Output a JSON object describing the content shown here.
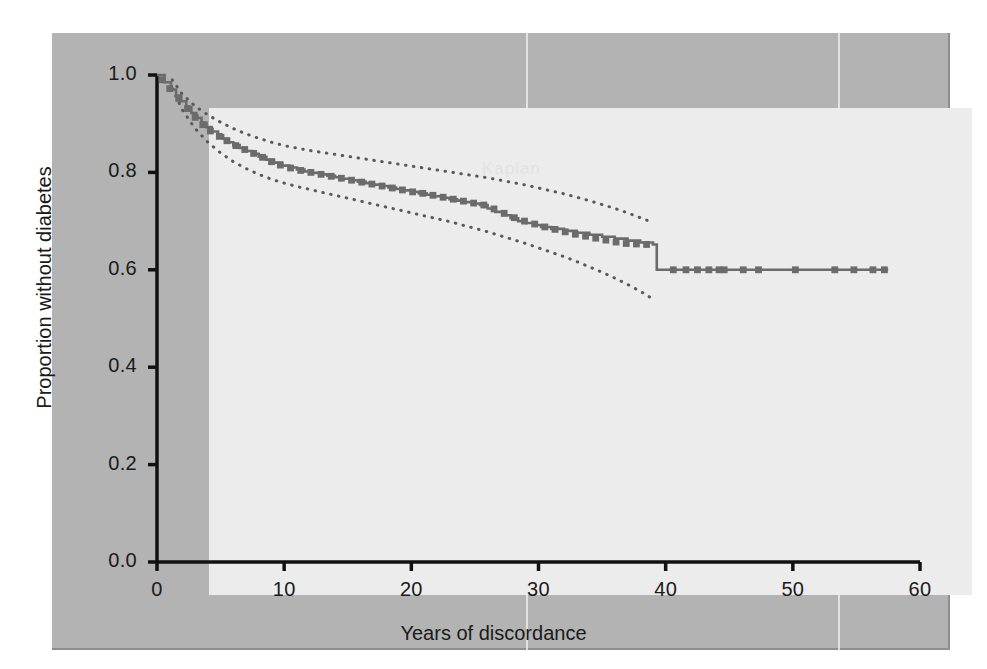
{
  "figure": {
    "watermark_text": "Kaplan",
    "panel_color": "#b3b3b3",
    "plot_bg_color": "#ececec",
    "curve_color": "#6b6b6b",
    "ci_color": "#595959",
    "axis_color": "#111111"
  },
  "chart_data": {
    "type": "line",
    "title": "",
    "subtitle": "",
    "xlabel": "Years of discordance",
    "ylabel": "Proportion without diabetes",
    "xlim": [
      0,
      60
    ],
    "ylim": [
      0.0,
      1.0
    ],
    "xticks": [
      0,
      10,
      20,
      30,
      40,
      50,
      60
    ],
    "xtick_labels": [
      "0",
      "10",
      "20",
      "30",
      "40",
      "50",
      "60"
    ],
    "yticks": [
      0.0,
      0.2,
      0.4,
      0.6,
      0.8,
      1.0
    ],
    "ytick_labels": [
      "0.0",
      "0.2",
      "0.4",
      "0.6",
      "0.8",
      "1.0"
    ],
    "grid": false,
    "legend": null,
    "legend_position": "none",
    "annotations": [],
    "series": [
      {
        "name": "Proportion without diabetes (Kaplan-Meier estimate)",
        "style": "step",
        "color": "#6b6b6b",
        "x": [
          0.0,
          0.6,
          1.1,
          1.5,
          1.9,
          2.3,
          2.7,
          3.1,
          3.5,
          3.9,
          4.3,
          4.8,
          5.2,
          5.6,
          6.0,
          6.5,
          7.0,
          7.5,
          8.0,
          8.6,
          9.2,
          9.8,
          10.4,
          11.0,
          11.6,
          12.2,
          12.8,
          13.4,
          14.0,
          14.6,
          15.2,
          15.8,
          16.4,
          17.0,
          17.6,
          18.2,
          18.8,
          19.4,
          20.0,
          20.6,
          21.2,
          21.8,
          22.4,
          23.0,
          23.6,
          24.2,
          24.8,
          25.4,
          26.0,
          26.6,
          27.2,
          27.8,
          28.4,
          29.0,
          29.6,
          30.2,
          31.0,
          32.0,
          33.0,
          34.0,
          35.0,
          36.0,
          37.0,
          38.0,
          39.0,
          39.3,
          57.5
        ],
        "y": [
          1.0,
          0.985,
          0.97,
          0.958,
          0.946,
          0.934,
          0.922,
          0.912,
          0.902,
          0.893,
          0.884,
          0.876,
          0.869,
          0.862,
          0.856,
          0.85,
          0.844,
          0.838,
          0.832,
          0.826,
          0.82,
          0.814,
          0.81,
          0.806,
          0.802,
          0.799,
          0.796,
          0.793,
          0.79,
          0.787,
          0.784,
          0.781,
          0.778,
          0.775,
          0.772,
          0.769,
          0.766,
          0.763,
          0.76,
          0.757,
          0.754,
          0.751,
          0.748,
          0.745,
          0.742,
          0.739,
          0.736,
          0.733,
          0.726,
          0.719,
          0.712,
          0.706,
          0.7,
          0.696,
          0.692,
          0.688,
          0.684,
          0.68,
          0.676,
          0.672,
          0.668,
          0.664,
          0.66,
          0.656,
          0.652,
          0.6,
          0.6
        ]
      },
      {
        "name": "Upper 95% confidence limit",
        "style": "dotted",
        "color": "#595959",
        "x": [
          1.2,
          2.0,
          3.0,
          4.0,
          5.0,
          6.0,
          7.0,
          8.0,
          9.0,
          10.0,
          11.0,
          12.0,
          13.0,
          14.0,
          15.0,
          16.0,
          17.0,
          18.0,
          19.0,
          20.0,
          21.0,
          22.0,
          23.0,
          24.0,
          25.0,
          26.0,
          27.0,
          28.0,
          29.0,
          30.0,
          31.0,
          32.0,
          33.0,
          34.0,
          35.0,
          36.0,
          37.0,
          38.0,
          39.0
        ],
        "y": [
          0.99,
          0.96,
          0.936,
          0.918,
          0.903,
          0.89,
          0.879,
          0.87,
          0.862,
          0.855,
          0.85,
          0.845,
          0.841,
          0.837,
          0.833,
          0.829,
          0.825,
          0.821,
          0.817,
          0.813,
          0.809,
          0.805,
          0.801,
          0.797,
          0.793,
          0.789,
          0.784,
          0.779,
          0.774,
          0.768,
          0.762,
          0.756,
          0.749,
          0.742,
          0.734,
          0.726,
          0.717,
          0.707,
          0.697
        ]
      },
      {
        "name": "Lower 95% confidence limit",
        "style": "dotted",
        "color": "#595959",
        "x": [
          1.2,
          2.0,
          3.0,
          4.0,
          5.0,
          6.0,
          7.0,
          8.0,
          9.0,
          10.0,
          11.0,
          12.0,
          13.0,
          14.0,
          15.0,
          16.0,
          17.0,
          18.0,
          19.0,
          20.0,
          21.0,
          22.0,
          23.0,
          24.0,
          25.0,
          26.0,
          27.0,
          28.0,
          29.0,
          30.0,
          31.0,
          32.0,
          33.0,
          34.0,
          35.0,
          36.0,
          37.0,
          38.0,
          39.0
        ],
        "y": [
          0.972,
          0.928,
          0.89,
          0.862,
          0.84,
          0.822,
          0.808,
          0.796,
          0.786,
          0.778,
          0.771,
          0.765,
          0.759,
          0.753,
          0.747,
          0.741,
          0.735,
          0.729,
          0.723,
          0.717,
          0.711,
          0.705,
          0.699,
          0.692,
          0.685,
          0.678,
          0.67,
          0.662,
          0.654,
          0.645,
          0.636,
          0.627,
          0.617,
          0.606,
          0.595,
          0.583,
          0.57,
          0.556,
          0.54
        ]
      }
    ],
    "censor_marks": {
      "name": "Censored observations",
      "x": [
        0.4,
        1.0,
        1.7,
        2.4,
        3.0,
        3.6,
        4.2,
        4.9,
        5.5,
        6.2,
        6.9,
        7.6,
        8.3,
        9.0,
        9.7,
        10.5,
        11.3,
        12.1,
        12.9,
        13.7,
        14.5,
        15.3,
        16.1,
        16.9,
        17.7,
        18.5,
        19.3,
        20.1,
        20.9,
        21.7,
        22.5,
        23.3,
        24.1,
        24.9,
        25.7,
        26.5,
        27.3,
        28.1,
        28.9,
        29.7,
        30.5,
        31.3,
        32.1,
        32.9,
        33.7,
        34.5,
        35.3,
        36.1,
        36.9,
        37.7,
        38.5,
        40.6,
        41.6,
        42.5,
        43.4,
        44.2,
        44.6,
        46.1,
        47.3,
        50.2,
        53.3,
        54.8,
        56.3,
        57.2
      ],
      "y": [
        0.99,
        0.972,
        0.952,
        0.931,
        0.913,
        0.898,
        0.885,
        0.874,
        0.865,
        0.855,
        0.847,
        0.839,
        0.831,
        0.822,
        0.815,
        0.809,
        0.804,
        0.8,
        0.796,
        0.792,
        0.788,
        0.784,
        0.78,
        0.776,
        0.772,
        0.768,
        0.764,
        0.76,
        0.757,
        0.753,
        0.749,
        0.745,
        0.741,
        0.737,
        0.733,
        0.725,
        0.716,
        0.707,
        0.7,
        0.694,
        0.688,
        0.683,
        0.678,
        0.673,
        0.669,
        0.665,
        0.661,
        0.657,
        0.654,
        0.653,
        0.652,
        0.6,
        0.6,
        0.6,
        0.6,
        0.6,
        0.6,
        0.6,
        0.6,
        0.6,
        0.6,
        0.6,
        0.6,
        0.6
      ]
    }
  }
}
